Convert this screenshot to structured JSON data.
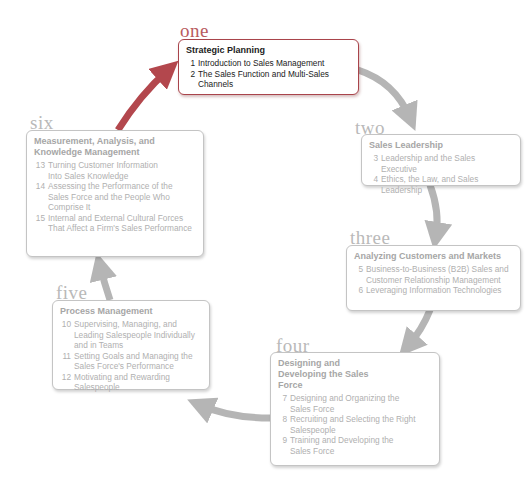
{
  "diagram": {
    "colors": {
      "active": "#a9444b",
      "inactive": "#b0b0b0",
      "arrow_gray": "#b5b5b5",
      "arrow_red": "#b3474d"
    },
    "stages": [
      {
        "label": "one",
        "title": "Strategic Planning",
        "active": true,
        "chapters": [
          {
            "num": "1",
            "text": "Introduction to Sales Management"
          },
          {
            "num": "2",
            "text": "The Sales Function and Multi-Sales Channels"
          }
        ]
      },
      {
        "label": "two",
        "title": "Sales Leadership",
        "active": false,
        "chapters": [
          {
            "num": "3",
            "text": "Leadership and the Sales Executive"
          },
          {
            "num": "4",
            "text": "Ethics, the Law, and Sales Leadership"
          }
        ]
      },
      {
        "label": "three",
        "title": "Analyzing Customers and Markets",
        "active": false,
        "chapters": [
          {
            "num": "5",
            "text": "Business-to-Business (B2B) Sales and Customer Relationship Management"
          },
          {
            "num": "6",
            "text": "Leveraging Information Technologies"
          }
        ]
      },
      {
        "label": "four",
        "title": "Designing and Developing the Sales Force",
        "active": false,
        "chapters": [
          {
            "num": "7",
            "text": "Designing and Organizing the Sales Force"
          },
          {
            "num": "8",
            "text": "Recruiting and Selecting the Right Salespeople"
          },
          {
            "num": "9",
            "text": "Training and Developing the Sales Force"
          }
        ]
      },
      {
        "label": "five",
        "title": "Process Management",
        "active": false,
        "chapters": [
          {
            "num": "10",
            "text": "Supervising, Managing, and Leading Salespeople Individually and in Teams"
          },
          {
            "num": "11",
            "text": "Setting Goals and Managing the Sales Force's Performance"
          },
          {
            "num": "12",
            "text": "Motivating and Rewarding Salespeople"
          }
        ]
      },
      {
        "label": "six",
        "title": "Measurement, Analysis, and Knowledge Management",
        "active": false,
        "chapters": [
          {
            "num": "13",
            "text": "Turning Customer Information Into Sales Knowledge"
          },
          {
            "num": "14",
            "text": "Assessing the Performance of the Sales Force and the People Who Comprise It"
          },
          {
            "num": "15",
            "text": "Internal and External Cultural Forces That Affect a Firm's Sales Performance"
          }
        ]
      }
    ]
  }
}
